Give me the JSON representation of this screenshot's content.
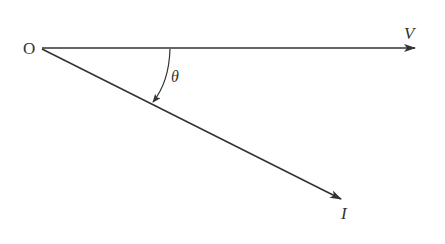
{
  "diagram": {
    "type": "phasor-diagram",
    "origin_label": "O",
    "vectors": [
      {
        "name": "voltage",
        "label": "V",
        "direction": "horizontal-right"
      },
      {
        "name": "current",
        "label": "I",
        "direction": "lagging-down-right"
      }
    ],
    "angle": {
      "label": "θ",
      "between": [
        "V",
        "I"
      ],
      "arrow_direction": "from V toward I"
    },
    "colors": {
      "line": "#333333",
      "background": "#ffffff"
    }
  }
}
